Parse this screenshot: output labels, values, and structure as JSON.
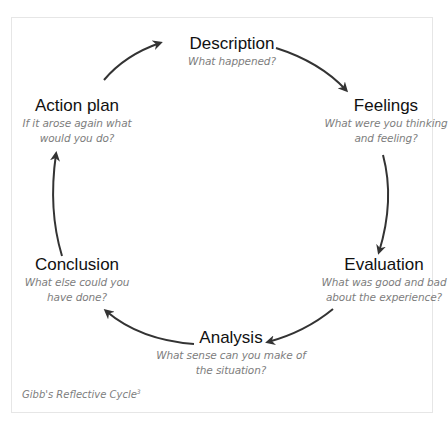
{
  "diagram": {
    "type": "cycle",
    "caption": "Gibb's Reflective Cycle",
    "caption_superscript": "3",
    "colors": {
      "title": "#111111",
      "subtitle": "#7d7d7d",
      "arrow": "#333333",
      "frame": "#e6e6e6"
    },
    "stages": [
      {
        "id": "description",
        "title": "Description",
        "subtitle_lines": [
          "What happened?"
        ]
      },
      {
        "id": "feelings",
        "title": "Feelings",
        "subtitle_lines": [
          "What were you thinking",
          "and feeling?"
        ]
      },
      {
        "id": "evaluation",
        "title": "Evaluation",
        "subtitle_lines": [
          "What was good and bad",
          "about the experience?"
        ]
      },
      {
        "id": "analysis",
        "title": "Analysis",
        "subtitle_lines": [
          "What sense can you make of",
          "the situation?"
        ]
      },
      {
        "id": "conclusion",
        "title": "Conclusion",
        "subtitle_lines": [
          "What else could you",
          "have done?"
        ]
      },
      {
        "id": "action-plan",
        "title": "Action plan",
        "subtitle_lines": [
          "If it arose again what",
          "would you do?"
        ]
      }
    ],
    "edges": [
      {
        "from": "description",
        "to": "feelings"
      },
      {
        "from": "feelings",
        "to": "evaluation"
      },
      {
        "from": "evaluation",
        "to": "analysis"
      },
      {
        "from": "analysis",
        "to": "conclusion"
      },
      {
        "from": "conclusion",
        "to": "action-plan"
      },
      {
        "from": "action-plan",
        "to": "description"
      }
    ]
  }
}
